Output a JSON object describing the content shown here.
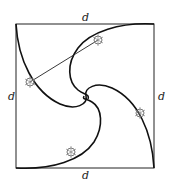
{
  "diagram": {
    "side_labels": {
      "top": "d",
      "left": "d",
      "right": "d",
      "bottom": "d"
    },
    "square": {
      "x": 16,
      "y": 24,
      "size": 139
    },
    "colors": {
      "line": "#111111",
      "bug": "#777777",
      "background": "#ffffff"
    },
    "bugs": [
      {
        "name": "bug-top",
        "x": 98,
        "y": 40
      },
      {
        "name": "bug-left",
        "x": 30,
        "y": 82
      },
      {
        "name": "bug-right",
        "x": 140,
        "y": 113
      },
      {
        "name": "bug-bottom",
        "x": 71,
        "y": 152
      }
    ]
  }
}
